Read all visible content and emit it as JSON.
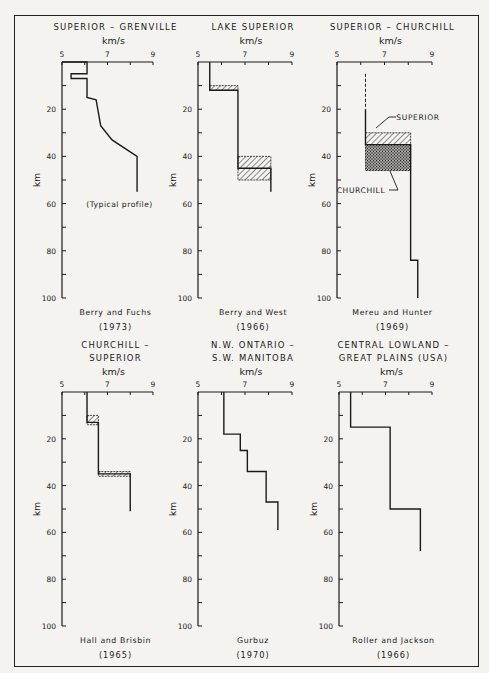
{
  "figure": {
    "frame": true,
    "colors": {
      "ink": "#1a1a1a",
      "paper": "#f4f3f0"
    }
  },
  "chart_data": [
    {
      "type": "line",
      "title": "SUPERIOR – GRENVILLE",
      "xlabel": "km/s",
      "ylabel": "km",
      "xticks": [
        "5",
        "7",
        "9"
      ],
      "yticks": [
        "20",
        "40",
        "60",
        "80",
        "100"
      ],
      "xlim": [
        5,
        9
      ],
      "ylim": [
        0,
        100
      ],
      "annotation": "(Typical profile)",
      "source": "Berry and Fuchs",
      "year": "(1973)",
      "profile": [
        [
          5.0,
          0
        ],
        [
          6.1,
          0
        ],
        [
          6.1,
          5
        ],
        [
          5.4,
          5
        ],
        [
          5.4,
          7
        ],
        [
          6.1,
          7
        ],
        [
          6.1,
          15
        ],
        [
          6.5,
          16
        ],
        [
          6.7,
          27
        ],
        [
          7.2,
          33
        ],
        [
          8.3,
          40
        ],
        [
          8.3,
          55
        ]
      ],
      "hatched_layers": []
    },
    {
      "type": "line",
      "title": "LAKE SUPERIOR",
      "xlabel": "km/s",
      "ylabel": "km",
      "xticks": [
        "5",
        "7",
        "9"
      ],
      "yticks": [
        "20",
        "40",
        "60",
        "80",
        "100"
      ],
      "xlim": [
        5,
        9
      ],
      "ylim": [
        0,
        100
      ],
      "source": "Berry and West",
      "year": "(1966)",
      "profile": [
        [
          5.5,
          0
        ],
        [
          5.5,
          12
        ],
        [
          6.7,
          12
        ],
        [
          6.7,
          45
        ],
        [
          8.1,
          45
        ],
        [
          8.1,
          55
        ]
      ],
      "hatched_layers": [
        {
          "vmin": 5.5,
          "vmax": 6.7,
          "dmin": 10,
          "dmax": 12,
          "pattern": "diag"
        },
        {
          "vmin": 6.7,
          "vmax": 8.1,
          "dmin": 40,
          "dmax": 50,
          "pattern": "diag"
        }
      ]
    },
    {
      "type": "line",
      "title": "SUPERIOR – CHURCHILL",
      "xlabel": "km/s",
      "ylabel": "km",
      "xticks": [
        "5",
        "7",
        "9"
      ],
      "yticks": [
        "20",
        "40",
        "60",
        "80",
        "100"
      ],
      "xlim": [
        5,
        9
      ],
      "ylim": [
        0,
        100
      ],
      "source": "Mereu and Hunter",
      "year": "(1969)",
      "labels": [
        "SUPERIOR",
        "CHURCHILL"
      ],
      "profile_dashed": [
        [
          6.2,
          5
        ],
        [
          6.2,
          20
        ]
      ],
      "profile": [
        [
          6.2,
          20
        ],
        [
          6.2,
          35
        ],
        [
          8.1,
          35
        ],
        [
          8.1,
          84
        ],
        [
          8.4,
          84
        ],
        [
          8.4,
          100
        ]
      ],
      "hatched_layers": [
        {
          "vmin": 6.2,
          "vmax": 8.1,
          "dmin": 30,
          "dmax": 35,
          "pattern": "diag",
          "label": "SUPERIOR"
        },
        {
          "vmin": 6.2,
          "vmax": 8.1,
          "dmin": 35,
          "dmax": 46,
          "pattern": "cross",
          "label": "CHURCHILL"
        }
      ]
    },
    {
      "type": "line",
      "title": "CHURCHILL – SUPERIOR",
      "xlabel": "km/s",
      "ylabel": "km",
      "xticks": [
        "5",
        "7",
        "9"
      ],
      "yticks": [
        "20",
        "40",
        "60",
        "80",
        "100"
      ],
      "xlim": [
        5,
        9
      ],
      "ylim": [
        0,
        100
      ],
      "source": "Hall and Brisbin",
      "year": "(1965)",
      "profile": [
        [
          6.1,
          0
        ],
        [
          6.1,
          13
        ],
        [
          6.6,
          13
        ],
        [
          6.6,
          35
        ],
        [
          8.0,
          35
        ],
        [
          8.0,
          51
        ]
      ],
      "hatched_layers": [
        {
          "vmin": 6.1,
          "vmax": 6.6,
          "dmin": 10,
          "dmax": 14,
          "pattern": "diag"
        },
        {
          "vmin": 6.6,
          "vmax": 8.0,
          "dmin": 34,
          "dmax": 36,
          "pattern": "diag"
        }
      ]
    },
    {
      "type": "line",
      "title": "N.W. ONTARIO – S.W. MANITOBA",
      "xlabel": "km/s",
      "ylabel": "km",
      "xticks": [
        "5",
        "7",
        "9"
      ],
      "yticks": [
        "20",
        "40",
        "60",
        "80",
        "100"
      ],
      "xlim": [
        5,
        9
      ],
      "ylim": [
        0,
        100
      ],
      "source": "Gurbuz",
      "year": "(1970)",
      "profile": [
        [
          6.1,
          0
        ],
        [
          6.1,
          18
        ],
        [
          6.8,
          18
        ],
        [
          6.8,
          25
        ],
        [
          7.1,
          25
        ],
        [
          7.1,
          34
        ],
        [
          7.9,
          34
        ],
        [
          7.9,
          47
        ],
        [
          8.4,
          47
        ],
        [
          8.4,
          59
        ]
      ],
      "hatched_layers": []
    },
    {
      "type": "line",
      "title": "CENTRAL LOWLAND – GREAT PLAINS (USA)",
      "xlabel": "km/s",
      "ylabel": "km",
      "xticks": [
        "5",
        "7",
        "9"
      ],
      "yticks": [
        "20",
        "40",
        "60",
        "80",
        "100"
      ],
      "xlim": [
        5,
        9
      ],
      "ylim": [
        0,
        100
      ],
      "source": "Roller and Jackson",
      "year": "(1966)",
      "profile": [
        [
          5.5,
          0
        ],
        [
          5.5,
          15
        ],
        [
          7.2,
          15
        ],
        [
          7.2,
          50
        ],
        [
          8.5,
          50
        ],
        [
          8.5,
          68
        ]
      ],
      "hatched_layers": []
    }
  ],
  "panels": [
    {
      "title_lines": [
        "SUPERIOR – GRENVILLE"
      ],
      "unit": "km/s",
      "x5": "5",
      "x7": "7",
      "x9": "9",
      "y20": "20",
      "y40": "40",
      "y60": "60",
      "y80": "80",
      "y100": "100",
      "ylabel": "km",
      "annotation": "(Typical profile)",
      "source": "Berry and Fuchs",
      "year": "(1973)"
    },
    {
      "title_lines": [
        "LAKE SUPERIOR"
      ],
      "unit": "km/s",
      "x5": "5",
      "x7": "7",
      "x9": "9",
      "y20": "20",
      "y40": "40",
      "y60": "60",
      "y80": "80",
      "y100": "100",
      "ylabel": "km",
      "source": "Berry and West",
      "year": "(1966)"
    },
    {
      "title_lines": [
        "SUPERIOR – CHURCHILL"
      ],
      "unit": "km/s",
      "x5": "5",
      "x7": "7",
      "x9": "9",
      "y20": "20",
      "y40": "40",
      "y60": "60",
      "y80": "80",
      "y100": "100",
      "ylabel": "km",
      "label_a": "SUPERIOR",
      "label_b": "CHURCHILL",
      "source": "Mereu and Hunter",
      "year": "(1969)"
    },
    {
      "title_lines": [
        "CHURCHILL –",
        "SUPERIOR"
      ],
      "unit": "km/s",
      "x5": "5",
      "x7": "7",
      "x9": "9",
      "y20": "20",
      "y40": "40",
      "y60": "60",
      "y80": "80",
      "y100": "100",
      "ylabel": "km",
      "source": "Hall and Brisbin",
      "year": "(1965)"
    },
    {
      "title_lines": [
        "N.W. ONTARIO –",
        "S.W. MANITOBA"
      ],
      "unit": "km/s",
      "x5": "5",
      "x7": "7",
      "x9": "9",
      "y20": "20",
      "y40": "40",
      "y60": "60",
      "y80": "80",
      "y100": "100",
      "ylabel": "km",
      "source": "Gurbuz",
      "year": "(1970)"
    },
    {
      "title_lines": [
        "CENTRAL LOWLAND –",
        "GREAT PLAINS (USA)"
      ],
      "unit": "km/s",
      "x5": "5",
      "x7": "7",
      "x9": "9",
      "y20": "20",
      "y40": "40",
      "y60": "60",
      "y80": "80",
      "y100": "100",
      "ylabel": "km",
      "source": "Roller and Jackson",
      "year": "(1966)"
    }
  ]
}
